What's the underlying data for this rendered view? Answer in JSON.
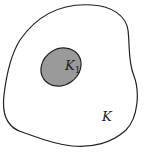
{
  "diagram": {
    "outer_region": {
      "label": "K",
      "fill": "#ffffff",
      "stroke": "#222222"
    },
    "inner_region": {
      "label": "K",
      "subscript": "1",
      "fill": "#9a9a9a",
      "stroke": "#222222"
    }
  }
}
